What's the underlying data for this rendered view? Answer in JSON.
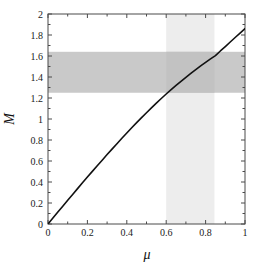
{
  "chart_data": {
    "type": "line",
    "title": "",
    "subtitle": "",
    "xlabel": "μ",
    "ylabel": "M",
    "xlim": [
      0,
      1
    ],
    "ylim": [
      0,
      2
    ],
    "grid": false,
    "legend": null,
    "legend_position": "none",
    "x_ticks": [
      0,
      0.2,
      0.4,
      0.6,
      0.8,
      1
    ],
    "x_tick_labels": [
      "0",
      "0.2",
      "0.4",
      "0.6",
      "0.8",
      "1"
    ],
    "x_minor_ticks": [
      0.1,
      0.3,
      0.5,
      0.7,
      0.9
    ],
    "y_ticks": [
      0,
      0.2,
      0.4,
      0.6,
      0.8,
      1,
      1.2,
      1.4,
      1.6,
      1.8,
      2
    ],
    "y_tick_labels": [
      "0",
      "0.2",
      "0.4",
      "0.6",
      "0.8",
      "1",
      "1.2",
      "1.4",
      "1.6",
      "1.8",
      "2"
    ],
    "y_minor_ticks": [
      0.1,
      0.3,
      0.5,
      0.7,
      0.9,
      1.1,
      1.3,
      1.5,
      1.7,
      1.9
    ],
    "series": [
      {
        "name": "M(μ)",
        "color": "#111111",
        "linewidth": 1.6,
        "x": [
          0.0,
          0.025,
          0.05,
          0.075,
          0.1,
          0.125,
          0.15,
          0.175,
          0.2,
          0.225,
          0.25,
          0.275,
          0.3,
          0.325,
          0.35,
          0.375,
          0.4,
          0.425,
          0.45,
          0.475,
          0.5,
          0.525,
          0.55,
          0.575,
          0.6,
          0.625,
          0.65,
          0.675,
          0.7,
          0.725,
          0.75,
          0.775,
          0.8,
          0.825,
          0.85,
          0.875,
          0.9,
          0.925,
          0.95,
          0.975,
          1.0
        ],
        "y": [
          0.0,
          0.057,
          0.114,
          0.17,
          0.226,
          0.282,
          0.337,
          0.392,
          0.447,
          0.501,
          0.555,
          0.608,
          0.661,
          0.713,
          0.765,
          0.816,
          0.866,
          0.916,
          0.965,
          1.013,
          1.06,
          1.106,
          1.151,
          1.195,
          1.238,
          1.28,
          1.32,
          1.359,
          1.397,
          1.434,
          1.47,
          1.505,
          1.539,
          1.572,
          1.604,
          1.648,
          1.69,
          1.733,
          1.776,
          1.818,
          1.86
        ]
      }
    ],
    "shaded_regions": [
      {
        "name": "mass-constraint-band",
        "orientation": "horizontal",
        "axis": "y",
        "from": 1.25,
        "to": 1.64,
        "color": "#c9c9c9",
        "opacity": 1
      },
      {
        "name": "mu-constraint-band",
        "orientation": "vertical",
        "axis": "x",
        "from": 0.6,
        "to": 0.845,
        "color": "#ededed",
        "opacity": 1
      }
    ],
    "overlap_color": "#c2c2c2",
    "axis_color": "#4a4a4a",
    "background": "#ffffff"
  },
  "plot_box": {
    "left": 48,
    "top": 14,
    "right": 245,
    "bottom": 224
  }
}
